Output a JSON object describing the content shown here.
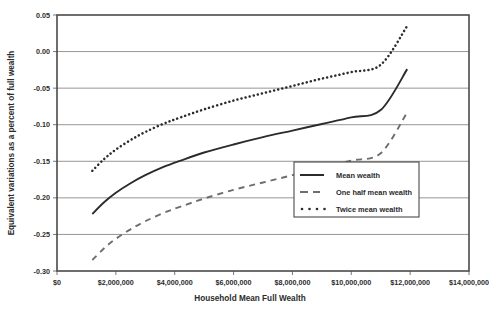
{
  "chart_data": {
    "type": "line",
    "title": "",
    "xlabel": "Household Mean Full Wealth",
    "ylabel": "Equivalent variations as a percent of full wealth",
    "xlim": [
      0,
      14000000
    ],
    "ylim": [
      -0.3,
      0.05
    ],
    "grid": true,
    "legend_position": "inside-lower-right",
    "x_tick_labels": [
      "$0",
      "$2,000,000",
      "$4,000,000",
      "$6,000,000",
      "$8,000,000",
      "$10,000,000",
      "$12,000,000",
      "$14,000,000"
    ],
    "x_tick_values": [
      0,
      2000000,
      4000000,
      6000000,
      8000000,
      10000000,
      12000000,
      14000000
    ],
    "y_tick_labels": [
      "0.05",
      "0.00",
      "-0.05",
      "-0.10",
      "-0.15",
      "-0.20",
      "-0.25",
      "-0.30"
    ],
    "y_tick_values": [
      0.05,
      0.0,
      -0.05,
      -0.1,
      -0.15,
      -0.2,
      -0.25,
      -0.3
    ],
    "x": [
      1200000,
      1600000,
      2000000,
      2500000,
      3000000,
      3600000,
      4200000,
      5000000,
      6000000,
      7000000,
      8000000,
      9000000,
      10000000,
      11000000,
      11900000
    ],
    "series": [
      {
        "name": "Mean wealth",
        "style": "solid",
        "color": "#2b2b2b",
        "values": [
          -0.222,
          -0.206,
          -0.193,
          -0.18,
          -0.169,
          -0.158,
          -0.149,
          -0.138,
          -0.127,
          -0.117,
          -0.108,
          -0.099,
          -0.09,
          -0.08,
          -0.024
        ]
      },
      {
        "name": "One half mean wealth",
        "style": "dashed",
        "color": "#6e6e6e",
        "values": [
          -0.285,
          -0.269,
          -0.256,
          -0.243,
          -0.232,
          -0.221,
          -0.212,
          -0.201,
          -0.189,
          -0.179,
          -0.169,
          -0.159,
          -0.149,
          -0.139,
          -0.083
        ]
      },
      {
        "name": "Twice mean wealth",
        "style": "dotted",
        "color": "#2b2b2b",
        "values": [
          -0.163,
          -0.147,
          -0.134,
          -0.121,
          -0.11,
          -0.099,
          -0.09,
          -0.079,
          -0.067,
          -0.057,
          -0.047,
          -0.037,
          -0.028,
          -0.018,
          0.035
        ]
      }
    ]
  },
  "legend": {
    "items": [
      {
        "label": "Mean wealth",
        "style": "solid"
      },
      {
        "label": "One half mean wealth",
        "style": "dashed"
      },
      {
        "label": "Twice mean wealth",
        "style": "dotted"
      }
    ]
  },
  "colors": {
    "background": "#ffffff",
    "axis": "#4a4a4a",
    "grid": "#8a8a8a",
    "text": "#2b2b2b",
    "series_solid": "#2b2b2b",
    "series_dashed": "#6e6e6e",
    "series_dotted": "#2b2b2b"
  }
}
